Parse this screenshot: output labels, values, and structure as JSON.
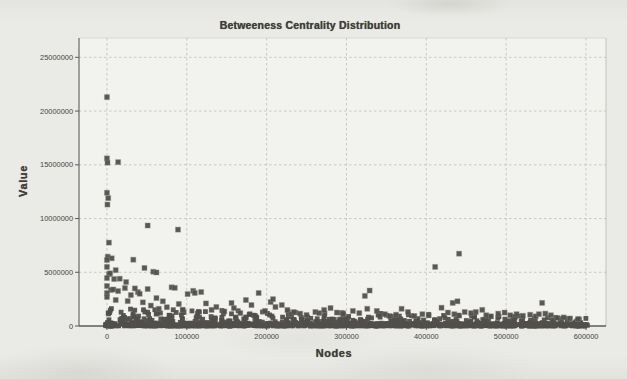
{
  "window": {
    "description": "scanned grayscale scatter chart page"
  },
  "chart": {
    "title": "Betweeness Centrality Distribution",
    "xlabel": "Nodes",
    "ylabel": "Value"
  },
  "colors": {
    "paper": "#eaeae6",
    "plot_background": "#f2f2ee",
    "grid": "#bfbfb8",
    "axis": "#5d5c56",
    "tick_text": "#45443f",
    "marker_fill": "#514f4b",
    "marker_halo": "#8a8882"
  },
  "chart_data": {
    "type": "scatter",
    "title": "Betweeness Centrality Distribution",
    "xlabel": "Nodes",
    "ylabel": "Value",
    "legend": false,
    "grid": true,
    "grid_style": "dashed",
    "marker": {
      "shape": "square",
      "size_px": 5,
      "color": "#514f4b",
      "halo": "#8a8882"
    },
    "xlim": [
      -35000,
      625000
    ],
    "ylim": [
      0,
      26800000
    ],
    "x_ticks": [
      0,
      100000,
      200000,
      300000,
      400000,
      500000,
      600000
    ],
    "x_tick_labels": [
      "0",
      "100000",
      "200000",
      "300000",
      "400000",
      "500000",
      "600000"
    ],
    "y_ticks": [
      0,
      5000000,
      10000000,
      15000000,
      20000000,
      25000000
    ],
    "y_tick_labels": [
      "0",
      "5000000",
      "10000000",
      "15000000",
      "20000000",
      "25000000"
    ],
    "points": [
      [
        0,
        21300000
      ],
      [
        0,
        15600000
      ],
      [
        700,
        15200000
      ],
      [
        14000,
        15250000
      ],
      [
        0,
        12400000
      ],
      [
        1600,
        11900000
      ],
      [
        600,
        11300000
      ],
      [
        2500,
        7760000
      ],
      [
        1000,
        6450000
      ],
      [
        6000,
        6300000
      ],
      [
        0,
        6140000
      ],
      [
        33000,
        6170000
      ],
      [
        51000,
        9350000
      ],
      [
        89000,
        8970000
      ],
      [
        0,
        5500000
      ],
      [
        47000,
        5400000
      ],
      [
        11000,
        5200000
      ],
      [
        58000,
        5050000
      ],
      [
        62000,
        4980000
      ],
      [
        2500,
        4830000
      ],
      [
        4000,
        4900000
      ],
      [
        0,
        4460000
      ],
      [
        9000,
        4370000
      ],
      [
        16000,
        4400000
      ],
      [
        24000,
        4090000
      ],
      [
        0,
        3720000
      ],
      [
        5000,
        3350000
      ],
      [
        8000,
        3400000
      ],
      [
        14000,
        3250000
      ],
      [
        22500,
        3530000
      ],
      [
        30000,
        2880000
      ],
      [
        38700,
        3160000
      ],
      [
        51000,
        3440000
      ],
      [
        35000,
        3500000
      ],
      [
        41000,
        3000000
      ],
      [
        0,
        3070000
      ],
      [
        0,
        2700000
      ],
      [
        11000,
        2420000
      ],
      [
        26000,
        2320000
      ],
      [
        81000,
        3600000
      ],
      [
        85000,
        3550000
      ],
      [
        45000,
        2200000
      ],
      [
        55000,
        1900000
      ],
      [
        62000,
        2600000
      ],
      [
        70000,
        2300000
      ],
      [
        75000,
        1750000
      ],
      [
        90000,
        2050000
      ],
      [
        95000,
        1500000
      ],
      [
        65000,
        1600000
      ],
      [
        101000,
        2970000
      ],
      [
        108000,
        3270000
      ],
      [
        110000,
        3070000
      ],
      [
        118000,
        3160000
      ],
      [
        124000,
        2100000
      ],
      [
        131000,
        1500000
      ],
      [
        137000,
        1770000
      ],
      [
        147000,
        1350000
      ],
      [
        156000,
        2140000
      ],
      [
        159000,
        1670000
      ],
      [
        167000,
        1200000
      ],
      [
        174000,
        2420000
      ],
      [
        181000,
        1950000
      ],
      [
        190000,
        3070000
      ],
      [
        198000,
        1400000
      ],
      [
        205000,
        2230000
      ],
      [
        208000,
        2500000
      ],
      [
        211000,
        1770000
      ],
      [
        219000,
        1950000
      ],
      [
        226000,
        1490000
      ],
      [
        231000,
        1100000
      ],
      [
        234000,
        1300000
      ],
      [
        242000,
        1150000
      ],
      [
        250000,
        1020000
      ],
      [
        261000,
        1300000
      ],
      [
        266000,
        1200000
      ],
      [
        272000,
        1490000
      ],
      [
        280000,
        1670000
      ],
      [
        288000,
        1250000
      ],
      [
        296000,
        1100000
      ],
      [
        308000,
        1400000
      ],
      [
        316000,
        1200000
      ],
      [
        323000,
        2800000
      ],
      [
        326000,
        1600000
      ],
      [
        329000,
        3300000
      ],
      [
        338000,
        1400000
      ],
      [
        348000,
        1100000
      ],
      [
        354000,
        930000
      ],
      [
        362000,
        1050000
      ],
      [
        369000,
        1600000
      ],
      [
        377000,
        1300000
      ],
      [
        385000,
        930000
      ],
      [
        395000,
        1100000
      ],
      [
        403000,
        980000
      ],
      [
        411000,
        5500000
      ],
      [
        419000,
        1700000
      ],
      [
        427000,
        1250000
      ],
      [
        433000,
        2150000
      ],
      [
        435000,
        1100000
      ],
      [
        439000,
        2300000
      ],
      [
        441000,
        6730000
      ],
      [
        448000,
        1300000
      ],
      [
        456000,
        1200000
      ],
      [
        462000,
        1300000
      ],
      [
        470000,
        1500000
      ],
      [
        475000,
        1000000
      ],
      [
        481000,
        900000
      ],
      [
        490000,
        1150000
      ],
      [
        498000,
        1250000
      ],
      [
        505000,
        1000000
      ],
      [
        513000,
        1100000
      ],
      [
        521000,
        950000
      ],
      [
        530000,
        1050000
      ],
      [
        537000,
        900000
      ],
      [
        541000,
        1100000
      ],
      [
        545000,
        2150000
      ],
      [
        549000,
        1150000
      ],
      [
        556000,
        1000000
      ],
      [
        564000,
        750000
      ],
      [
        572000,
        800000
      ],
      [
        580000,
        700000
      ],
      [
        590000,
        650000
      ]
    ],
    "dense_band": {
      "description": "near-solid band of overlapping square markers hugging y=0 across the full x range, density decreasing upward and slightly to the right",
      "seed": 7,
      "x_min": -2000,
      "x_max": 602000,
      "strip": {
        "count": 780,
        "y_max": 280000,
        "power": 2.6
      },
      "mid": {
        "count": 440,
        "y_min": 120000,
        "y_max_left": 1650000,
        "y_max_right": 820000,
        "power": 1.9,
        "x_power": 1.05
      }
    }
  }
}
